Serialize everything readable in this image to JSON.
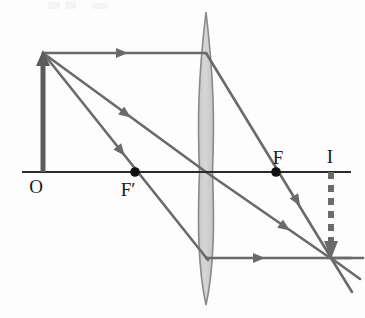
{
  "figure": {
    "type": "optics-ray-diagram",
    "background_color": "#fdfdfd"
  },
  "colors": {
    "axis": "#2b2b2b",
    "ray": "#6a6a6a",
    "object_arrow": "#5c5c5c",
    "image_arrow": "#6a6a6a",
    "lens_fill": "#cfcfcf",
    "lens_stroke": "#8a8a8a",
    "point_dot": "#111111",
    "label_text": "#1a1a1a"
  },
  "labels": [
    {
      "id": "object-label",
      "text": "O",
      "x": 36,
      "y": 193
    },
    {
      "id": "near-focus-label",
      "text": "F′",
      "x": 124,
      "y": 196
    },
    {
      "id": "far-focus-label",
      "text": "F",
      "x": 272,
      "y": 166
    },
    {
      "id": "image-label",
      "text": "I",
      "x": 327,
      "y": 164
    }
  ],
  "axis": {
    "name": "principal-axis",
    "x1": 22,
    "y1": 172,
    "x2": 351,
    "y2": 172,
    "stroke_width": 2.2
  },
  "lens": {
    "name": "converging-lens",
    "center_x": 206,
    "top_y": 12,
    "bottom_y": 305,
    "half_width": 6.5,
    "shape": "biconvex"
  },
  "object": {
    "name": "object-arrow",
    "base_x": 43,
    "base_y": 172,
    "tip_x": 43,
    "tip_y": 52,
    "stroke_width": 5,
    "style": "solid",
    "direction": "up"
  },
  "image": {
    "name": "image-arrow",
    "base_x": 331,
    "base_y": 172,
    "tip_x": 331,
    "tip_y": 257,
    "stroke_width": 5,
    "style": "dashed",
    "direction": "down"
  },
  "focal_points": [
    {
      "id": "near-focus-dot",
      "label": "F'",
      "x": 135,
      "y": 172,
      "r": 4.6
    },
    {
      "id": "far-focus-dot",
      "label": "F",
      "x": 276,
      "y": 172,
      "r": 4.6
    }
  ],
  "image_point": {
    "id": "image-convergence-point",
    "x": 331,
    "y": 258
  },
  "rays": [
    {
      "id": "ray-parallel-incident",
      "description": "Parallel ray from object tip to lens",
      "points": "43,53 206,53",
      "arrow_at": {
        "x": 122,
        "y": 53,
        "angle": 0
      }
    },
    {
      "id": "ray-parallel-refracted",
      "description": "Refracted through far focus F to image point",
      "points": "206,53 331,258",
      "arrow_at": {
        "x": 296,
        "y": 200,
        "angle": 58.6
      }
    },
    {
      "id": "ray-center-incident",
      "description": "Ray from object tip toward lens optical center",
      "points": "43,53 206,172",
      "arrow_at": {
        "x": 125,
        "y": 113,
        "angle": 36.1
      }
    },
    {
      "id": "ray-center-refracted",
      "description": "Undeviated ray through optical center to image point",
      "points": "206,172 331,258",
      "arrow_at": {
        "x": 283,
        "y": 225,
        "angle": 34.5
      }
    },
    {
      "id": "ray-focal-incident",
      "description": "Ray from object tip through near focus F' to lens",
      "points": "43,53 206,258",
      "arrow_at": {
        "x": 120,
        "y": 150,
        "angle": 51.5
      }
    },
    {
      "id": "ray-focal-refracted",
      "description": "Refracted parallel to axis to image point",
      "points": "206,258 351,258",
      "arrow_at": {
        "x": 258,
        "y": 258,
        "angle": 0
      }
    },
    {
      "id": "ray-overshoot-center",
      "description": "Center ray continuing past image point",
      "points": "331,258 360,278",
      "arrow_at": null
    },
    {
      "id": "ray-overshoot-parallel",
      "description": "Focal ray continuing past image point",
      "points": "331,258 352,292",
      "arrow_at": null
    },
    {
      "id": "ray-overshoot-horizontal",
      "description": "Horizontal ray continuing past image point",
      "points": "331,258 362,258",
      "arrow_at": null
    }
  ]
}
